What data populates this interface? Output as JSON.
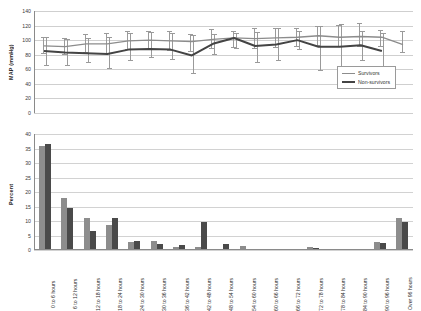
{
  "chart_data": [
    {
      "type": "line",
      "panel": "top",
      "title": "",
      "xlabel": "",
      "ylabel": "MAP (mmHg)",
      "ylim": [
        0,
        140
      ],
      "yticks": [
        0,
        20,
        40,
        60,
        80,
        100,
        120,
        140
      ],
      "grid": true,
      "legend_position": "bottom-right",
      "x": [
        "0 to 6 hours",
        "6 to 12 hours",
        "12 to 18 hours",
        "18 to 24 hours",
        "24 to 30 hours",
        "30 to 36 hours",
        "36 to 42 hours",
        "42 to 48 hours",
        "48 to 54 hours",
        "54 to 60 hours",
        "60 to 66 hours",
        "66 to 72 hours",
        "72 to 78 hours",
        "78 to 84 hours",
        "84 to 90 hours",
        "90 to 96 hours",
        "Over 96 hours"
      ],
      "series": [
        {
          "name": "Survivors",
          "color": "#8c8c8c",
          "values": [
            92,
            91,
            95,
            95,
            99,
            100,
            99,
            98,
            101,
            103,
            102,
            103,
            104,
            106,
            104,
            105,
            104,
            94
          ],
          "err_low": [
            81,
            80,
            82,
            81,
            86,
            87,
            85,
            84,
            88,
            89,
            88,
            89,
            90,
            92,
            90,
            91,
            90,
            82
          ],
          "err_high": [
            105,
            103,
            108,
            110,
            113,
            113,
            113,
            108,
            115,
            113,
            116,
            117,
            116,
            119,
            121,
            124,
            114,
            112
          ]
        },
        {
          "name": "Non-survivors",
          "color": "#444444",
          "values": [
            85,
            83,
            82,
            81,
            87,
            88,
            87,
            79,
            95,
            103,
            92,
            94,
            100,
            91,
            91,
            93,
            85
          ],
          "err_low": [
            64,
            65,
            68,
            60,
            72,
            75,
            73,
            53,
            80,
            88,
            68,
            72,
            87,
            57,
            52,
            72,
            61
          ],
          "err_high": [
            105,
            101,
            103,
            104,
            110,
            111,
            110,
            107,
            108,
            110,
            111,
            116,
            112,
            120,
            122,
            112,
            110
          ]
        }
      ]
    },
    {
      "type": "bar",
      "panel": "bottom",
      "title": "",
      "xlabel": "",
      "ylabel": "Percent",
      "ylim": [
        0,
        40
      ],
      "yticks": [
        0,
        5,
        10,
        15,
        20,
        25,
        30,
        35,
        40
      ],
      "grid": true,
      "categories": [
        "0 to 6 hours",
        "6 to 12 hours",
        "12 to 18 hours",
        "18 to 24 hours",
        "24 to 30 hours",
        "30 to 36 hours",
        "36 to 42 hours",
        "42 to 48 hours",
        "48 to 54 hours",
        "54 to 60 hours",
        "60 to 66 hours",
        "66 to 72 hours",
        "72 to 78 hours",
        "78 to 84 hours",
        "84 to 90 hours",
        "90 to 96 hours",
        "Over 96 hours"
      ],
      "series": [
        {
          "name": "Survivors",
          "color": "#8d8d8d",
          "values": [
            36.0,
            18.0,
            11.0,
            8.5,
            2.7,
            3.0,
            1.1,
            1.2,
            0.4,
            1.3,
            0.0,
            0.0,
            1.0,
            0.0,
            0.2,
            2.7,
            11.0
          ]
        },
        {
          "name": "Non-survivors",
          "color": "#4a4a4a",
          "values": [
            36.5,
            14.5,
            6.5,
            11.0,
            3.2,
            2.2,
            1.7,
            9.5,
            2.1,
            0.0,
            0.0,
            0.0,
            0.7,
            0.0,
            0.0,
            2.5,
            9.5
          ]
        }
      ]
    }
  ],
  "legend": {
    "items": [
      {
        "label": "Survivors"
      },
      {
        "label": "Non-survivors"
      }
    ]
  },
  "axes": {
    "top_ylabel": "MAP (mmHg)",
    "bottom_ylabel": "Percent"
  }
}
